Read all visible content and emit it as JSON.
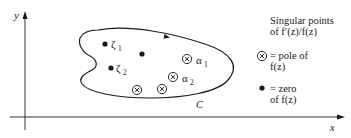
{
  "axes": {
    "x_label": "x",
    "y_label": "y"
  },
  "contour": {
    "label": "C"
  },
  "points": {
    "zeros": [
      {
        "label": "ζ",
        "sub": "1"
      },
      {
        "label": "ζ",
        "sub": "2"
      },
      {
        "label": ""
      }
    ],
    "poles": [
      {
        "label": "α",
        "sub": "1"
      },
      {
        "label": "α",
        "sub": "2"
      },
      {
        "label": ""
      },
      {
        "label": ""
      }
    ]
  },
  "legend": {
    "title_line1": "Singular points",
    "title_line2": "of f′(z)/f(z)",
    "pole_line1": "= pole of",
    "pole_line2": "f(z)",
    "zero_line1": "= zero",
    "zero_line2": "of f(z)"
  },
  "colors": {
    "ink": "#1a1a1a",
    "background": "#ffffff"
  }
}
